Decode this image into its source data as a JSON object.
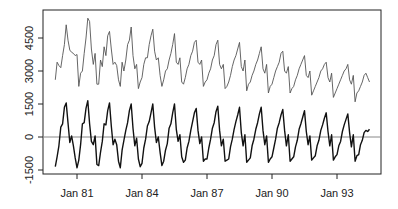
{
  "chart_data": {
    "type": "line",
    "title": "",
    "xlabel": "",
    "ylabel": "",
    "x_start": "Jan 1980",
    "x_frequency": "monthly",
    "x_ticks": [
      "Jan 81",
      "Jan 84",
      "Jan 87",
      "Jan 90",
      "Jan 93"
    ],
    "x_tick_years": [
      1981,
      1984,
      1987,
      1990,
      1993
    ],
    "xlim_years": [
      1979.4,
      1995.0
    ],
    "y_ticks": [
      -1500,
      0,
      1500,
      3000,
      4500
    ],
    "y_tick_labels": [
      "-1500",
      "0",
      "1500",
      "3000",
      "4500"
    ],
    "ylim": [
      -1700,
      5600
    ],
    "reference_line": {
      "y": 0,
      "color": "#888888"
    },
    "grid": false,
    "legend": "none",
    "series": [
      {
        "name": "original",
        "color": "#555555",
        "values": [
          2600,
          3400,
          3250,
          3150,
          3700,
          4200,
          5100,
          4400,
          3950,
          3850,
          3800,
          3700,
          3750,
          2300,
          2900,
          3000,
          3800,
          4500,
          5400,
          5250,
          4000,
          3300,
          3800,
          2400,
          2400,
          3500,
          3200,
          4100,
          3700,
          4600,
          4800,
          4000,
          3300,
          3400,
          3250,
          2600,
          2300,
          3400,
          3000,
          3500,
          4200,
          4400,
          5000,
          3700,
          3100,
          3300,
          2200,
          2500,
          2700,
          3300,
          3600,
          3600,
          4200,
          4600,
          4900,
          3900,
          3500,
          3600,
          2800,
          2300,
          2600,
          3000,
          3100,
          3500,
          3800,
          4200,
          4700,
          3400,
          3300,
          3600,
          2500,
          2400,
          2700,
          3100,
          3300,
          3700,
          3900,
          4300,
          4400,
          3400,
          3300,
          3500,
          2300,
          2500,
          2600,
          2900,
          3100,
          3500,
          3700,
          4200,
          4400,
          3300,
          3100,
          3300,
          2200,
          2300,
          2500,
          2800,
          3200,
          3500,
          3700,
          4000,
          4300,
          3200,
          3000,
          3500,
          2100,
          2400,
          2500,
          2800,
          3000,
          3300,
          3500,
          3800,
          4100,
          3100,
          2900,
          3300,
          2000,
          2300,
          2400,
          2700,
          3000,
          3200,
          3400,
          3800,
          3900,
          3000,
          2900,
          3200,
          2000,
          2200,
          2300,
          2600,
          2800,
          3100,
          3300,
          3500,
          3700,
          2800,
          2700,
          3000,
          1900,
          2100,
          2300,
          2500,
          2700,
          3000,
          3100,
          3300,
          3400,
          2700,
          2500,
          2900,
          1800,
          2000,
          2200,
          2400,
          2600,
          2800,
          3000,
          3100,
          3300,
          2600,
          2400,
          2800,
          1600,
          2000,
          2100,
          2300,
          2500,
          2800,
          2900,
          2700,
          2500
        ]
      },
      {
        "name": "detrended",
        "color": "#111111",
        "values": [
          -1350,
          -900,
          -400,
          450,
          600,
          1350,
          1550,
          650,
          -250,
          50,
          -400,
          -950,
          -1400,
          -1050,
          -350,
          600,
          650,
          1300,
          1650,
          600,
          -200,
          -350,
          50,
          -1250,
          -1300,
          -700,
          -200,
          600,
          550,
          1200,
          1550,
          500,
          -350,
          -100,
          -350,
          -1100,
          -1400,
          -600,
          -150,
          300,
          650,
          1200,
          1500,
          400,
          -400,
          -50,
          -1000,
          -1350,
          -1200,
          -500,
          -100,
          500,
          700,
          1100,
          1500,
          450,
          -250,
          0,
          -700,
          -1300,
          -1100,
          -600,
          -300,
          400,
          600,
          1100,
          1500,
          350,
          -200,
          100,
          -900,
          -1150,
          -1050,
          -500,
          -200,
          300,
          700,
          1100,
          1300,
          300,
          -300,
          0,
          -1100,
          -1000,
          -1000,
          -500,
          -100,
          400,
          650,
          1150,
          1400,
          300,
          -400,
          -100,
          -1100,
          -1050,
          -1000,
          -450,
          -100,
          350,
          700,
          1000,
          1350,
          200,
          -400,
          100,
          -1150,
          -1050,
          -950,
          -400,
          -100,
          350,
          650,
          1050,
          1350,
          300,
          -350,
          50,
          -1150,
          -1000,
          -900,
          -500,
          -100,
          400,
          650,
          1000,
          1250,
          300,
          -400,
          100,
          -1100,
          -1000,
          -900,
          -450,
          -150,
          350,
          600,
          900,
          1200,
          250,
          -350,
          50,
          -1050,
          -950,
          -850,
          -400,
          -150,
          300,
          550,
          850,
          1100,
          250,
          -400,
          100,
          -1050,
          -900,
          -800,
          -400,
          -200,
          250,
          550,
          800,
          1050,
          200,
          -450,
          100,
          -1100,
          -850,
          -800,
          -350,
          -150,
          200,
          300,
          250,
          350
        ]
      }
    ]
  }
}
